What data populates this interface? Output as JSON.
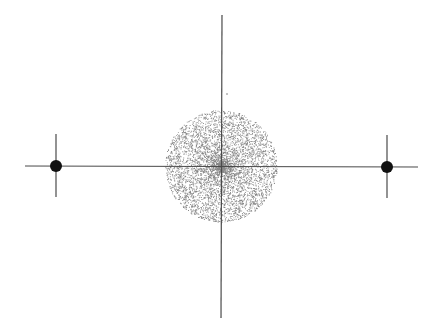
{
  "figure": {
    "width": 436,
    "height": 330,
    "background": "#ffffff",
    "line_color": "#4a4a4a",
    "dot_color": "#111111",
    "cloud_color": "#222222"
  },
  "axes": {
    "horizontal": {
      "x1": 25,
      "y1": 166,
      "x2": 418,
      "y2": 167
    },
    "vertical": {
      "x1": 222,
      "y1": 15,
      "x2": 221,
      "y2": 318
    }
  },
  "point_masses": [
    {
      "id": "left",
      "cx": 56,
      "cy": 166,
      "r": 6,
      "tick": {
        "y1": 134,
        "y2": 197
      }
    },
    {
      "id": "right",
      "cx": 387,
      "cy": 167,
      "r": 6,
      "tick": {
        "y1": 135,
        "y2": 198
      }
    }
  ],
  "particle_cloud": {
    "cx": 221,
    "cy": 166,
    "radius": 56,
    "count": 5200,
    "seed": 7,
    "dot_size": 0.9
  },
  "stray_particle": {
    "cx": 227,
    "cy": 94,
    "r": 0.8
  }
}
